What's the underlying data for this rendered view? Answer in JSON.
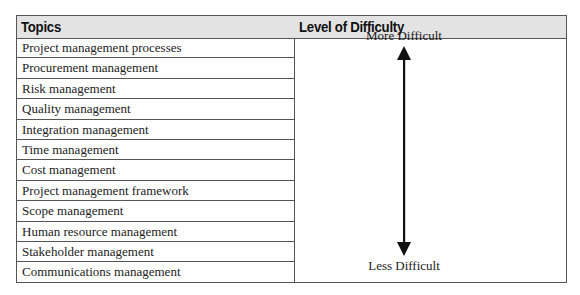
{
  "table": {
    "headers": [
      "Topics",
      "Level of Difficulty"
    ],
    "topics": [
      "Project management processes",
      "Procurement management",
      "Risk management",
      "Quality management",
      "Integration management",
      "Time management",
      "Cost management",
      "Project management framework",
      "Scope management",
      "Human resource management",
      "Stakeholder management",
      "Communications management"
    ],
    "difficulty": {
      "top_label": "More Difficult",
      "bottom_label": "Less Difficult",
      "arrow": "double-headed-vertical-arrow"
    }
  }
}
